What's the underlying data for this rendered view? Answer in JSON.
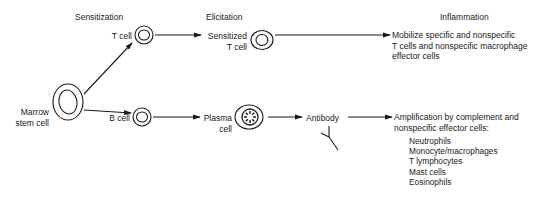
{
  "stages": {
    "sensitization": "Sensitization",
    "elicitation": "Elicitation",
    "inflammation": "Inflammation"
  },
  "cells": {
    "marrow_line1": "Marrow",
    "marrow_line2": "stem cell",
    "t_cell": "T cell",
    "b_cell": "B cell",
    "sensitized_line1": "Sensitized",
    "sensitized_line2": "T cell",
    "plasma_line1": "Plasma",
    "plasma_line2": "cell",
    "antibody": "Antibody"
  },
  "outcomes": {
    "t_path": {
      "line1": "Mobilize specific and nonspecific",
      "line2": "T cells and nonspecific macrophage",
      "line3": "effector cells"
    },
    "b_path": {
      "line1": "Amplification by complement and",
      "line2": "nonspecific effector cells:",
      "effectors": [
        "Neutrophils",
        "Monocyte/macrophages",
        "T lymphocytes",
        "Mast cells",
        "Eosinophils"
      ]
    }
  }
}
